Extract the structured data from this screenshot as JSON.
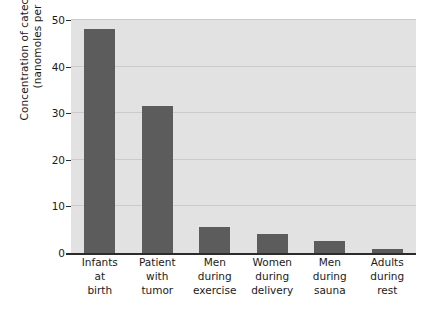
{
  "chart_data": {
    "type": "bar",
    "title": "",
    "subtitle": "",
    "xlabel": "",
    "ylabel_line1": "Concentration of catecholamines",
    "ylabel_line2": "(nanomoles per liter)",
    "ylim": [
      0,
      50
    ],
    "yticks": [
      50,
      40,
      30,
      20,
      10,
      0
    ],
    "grid": true,
    "legend": "none",
    "bar_color": "#5c5c5c",
    "plot_background": "#e2e2e2",
    "gridline_color": "#cbcbcb",
    "axis_color": "#2b2b2b",
    "categories": [
      "Infants at birth",
      "Patient with tumor",
      "Men during exercise",
      "Women during delivery",
      "Men during sauna",
      "Adults during rest"
    ],
    "category_lines": [
      [
        "Infants",
        "at",
        "birth"
      ],
      [
        "Patient",
        "with",
        "tumor"
      ],
      [
        "Men",
        "during",
        "exercise"
      ],
      [
        "Women",
        "during",
        "delivery"
      ],
      [
        "Men",
        "during",
        "sauna"
      ],
      [
        "Adults",
        "during",
        "rest"
      ]
    ],
    "values": [
      48,
      31.5,
      5.5,
      4,
      2.5,
      0.8
    ]
  }
}
